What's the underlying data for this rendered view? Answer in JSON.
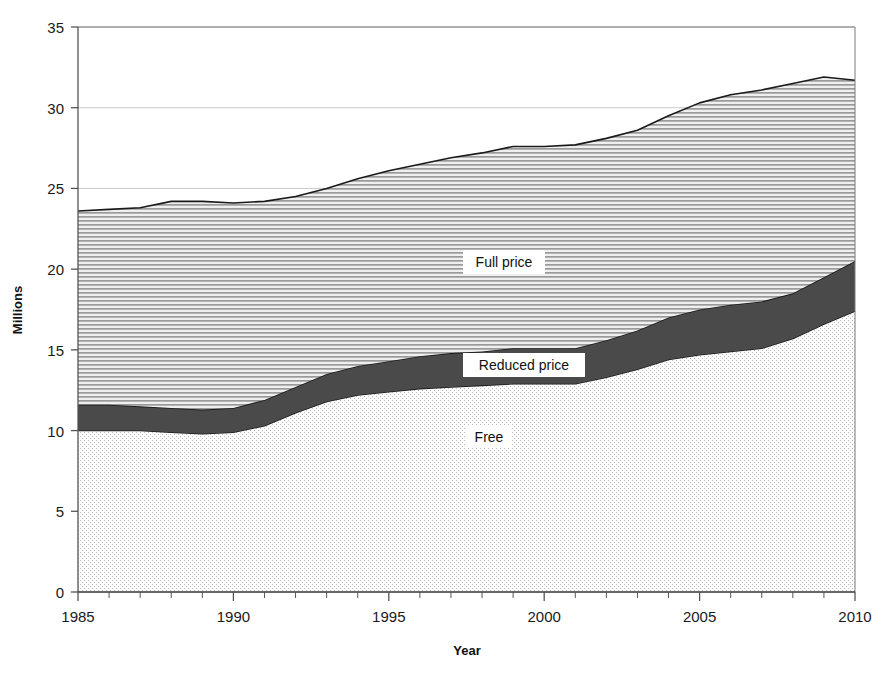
{
  "chart_data": {
    "type": "area",
    "stacked": true,
    "title": "",
    "xlabel": "Year",
    "ylabel": "Millions",
    "xlim": [
      1985,
      2010
    ],
    "ylim": [
      0,
      35
    ],
    "ytick_values": [
      0,
      5,
      10,
      15,
      20,
      25,
      30,
      35
    ],
    "ytick_labels": [
      "0",
      "5",
      "10",
      "15",
      "20",
      "25",
      "30",
      "35"
    ],
    "xtick_labels": [
      "1985",
      "1990",
      "1995",
      "2000",
      "2005",
      "2010"
    ],
    "xtick_values": [
      1985,
      1990,
      1995,
      2000,
      2005,
      2010
    ],
    "minor_xtick_interval": 1,
    "grid": "horizontal",
    "legend_position": "inline-annotations",
    "x": [
      1985,
      1986,
      1987,
      1988,
      1989,
      1990,
      1991,
      1992,
      1993,
      1994,
      1995,
      1996,
      1997,
      1998,
      1999,
      2000,
      2001,
      2002,
      2003,
      2004,
      2005,
      2006,
      2007,
      2008,
      2009,
      2010
    ],
    "series": [
      {
        "name": "Free",
        "pattern": "dotted-stipple",
        "color": "#f2f2f2",
        "values": [
          10.0,
          10.0,
          10.0,
          9.9,
          9.8,
          9.9,
          10.3,
          11.1,
          11.8,
          12.2,
          12.4,
          12.6,
          12.7,
          12.8,
          12.9,
          12.9,
          12.9,
          13.3,
          13.8,
          14.4,
          14.7,
          14.9,
          15.1,
          15.7,
          16.6,
          17.4
        ]
      },
      {
        "name": "Reduced price",
        "pattern": "solid-dark",
        "color": "#4a4a4a",
        "values": [
          1.6,
          1.6,
          1.5,
          1.5,
          1.5,
          1.5,
          1.6,
          1.6,
          1.7,
          1.8,
          1.9,
          2.0,
          2.1,
          2.1,
          2.2,
          2.2,
          2.2,
          2.3,
          2.4,
          2.6,
          2.8,
          2.9,
          2.9,
          2.8,
          2.9,
          3.1
        ]
      },
      {
        "name": "Full price",
        "pattern": "horizontal-hatch",
        "color": "#d8d8d8",
        "values": [
          12.0,
          12.1,
          12.3,
          12.8,
          12.9,
          12.7,
          12.3,
          11.8,
          11.5,
          11.6,
          11.8,
          11.9,
          12.1,
          12.3,
          12.5,
          12.5,
          12.6,
          12.5,
          12.4,
          12.5,
          12.8,
          13.0,
          13.1,
          13.0,
          12.4,
          11.2
        ]
      }
    ],
    "totals": [
      23.6,
      23.7,
      23.8,
      24.2,
      24.2,
      24.1,
      24.2,
      24.5,
      25.0,
      25.6,
      26.1,
      26.5,
      26.9,
      27.2,
      27.6,
      27.6,
      27.7,
      28.1,
      28.6,
      29.5,
      30.3,
      30.8,
      31.1,
      31.5,
      31.9,
      31.7
    ]
  },
  "annotations": {
    "full_price": "Full price",
    "reduced_price": "Reduced price",
    "free": "Free"
  },
  "colors": {
    "frame": "#7a7a7a",
    "grid": "#c9c9c9",
    "outline": "#1a1a1a",
    "free_fill": "#f2f2f2",
    "reduced_fill": "#4a4a4a",
    "full_fill": "#d8d8d8",
    "text": "#1a1a1a"
  }
}
